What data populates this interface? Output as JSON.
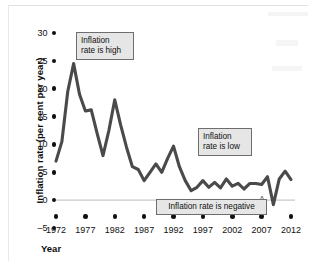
{
  "chart_data": {
    "type": "line",
    "title": "",
    "xlabel": "Year",
    "ylabel": "Inflation rate (per cent per year)",
    "xlim": [
      1972,
      2012
    ],
    "ylim": [
      -5,
      30
    ],
    "ytick_labels": [
      "30",
      "25",
      "20",
      "15",
      "10",
      "5",
      "0",
      "–5"
    ],
    "ytick_values": [
      30,
      25,
      20,
      15,
      10,
      5,
      0,
      -5
    ],
    "xtick_labels": [
      "1972",
      "1977",
      "1982",
      "1987",
      "1992",
      "1997",
      "2002",
      "2007",
      "2012"
    ],
    "xtick_values": [
      1972,
      1977,
      1982,
      1987,
      1992,
      1997,
      2002,
      2007,
      2012
    ],
    "grid": false,
    "legend": "none",
    "zero_line": true,
    "line_color": "#4a4a4a",
    "series": [
      {
        "name": "Inflation rate",
        "x": [
          1972,
          1973,
          1974,
          1975,
          1976,
          1977,
          1978,
          1979,
          1980,
          1981,
          1982,
          1983,
          1984,
          1985,
          1986,
          1987,
          1988,
          1989,
          1990,
          1991,
          1992,
          1993,
          1994,
          1995,
          1996,
          1997,
          1998,
          1999,
          2000,
          2001,
          2002,
          2003,
          2004,
          2005,
          2006,
          2007,
          2008,
          2009,
          2010,
          2011,
          2012
        ],
        "values": [
          7.0,
          10.5,
          19.5,
          24.5,
          19.0,
          16.0,
          16.2,
          12.0,
          8.0,
          12.5,
          18.0,
          13.5,
          9.5,
          6.0,
          5.5,
          3.5,
          5.0,
          6.5,
          5.0,
          7.5,
          9.7,
          6.0,
          3.5,
          1.7,
          2.3,
          3.5,
          2.3,
          3.2,
          2.2,
          3.8,
          2.5,
          3.0,
          2.0,
          3.0,
          3.0,
          2.8,
          4.2,
          -0.8,
          3.8,
          5.2,
          3.7
        ]
      }
    ],
    "annotations": [
      {
        "id": "high",
        "text_line1": "Inflation",
        "text_line2": "rate is high"
      },
      {
        "id": "low",
        "text_line1": "Inflation",
        "text_line2": "rate is low"
      },
      {
        "id": "negative",
        "text": "Inflation rate is negative"
      }
    ]
  },
  "axes": {
    "y_title": "Inflation rate (per cent per year)",
    "x_title": "Year"
  }
}
